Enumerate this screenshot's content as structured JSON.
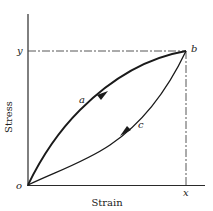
{
  "diagram": {
    "type": "stress-strain hysteresis loop",
    "axes": {
      "x_label": "Strain",
      "y_label": "Stress",
      "origin_label": "o"
    },
    "points": {
      "peak_label": "b",
      "x_marker_label": "x",
      "y_marker_label": "y"
    },
    "curves": [
      {
        "label": "a",
        "direction": "loading (o to b)"
      },
      {
        "label": "c",
        "direction": "unloading (b to o)"
      }
    ],
    "colors": {
      "line": "#1a1a1a",
      "background": "#ffffff"
    }
  }
}
